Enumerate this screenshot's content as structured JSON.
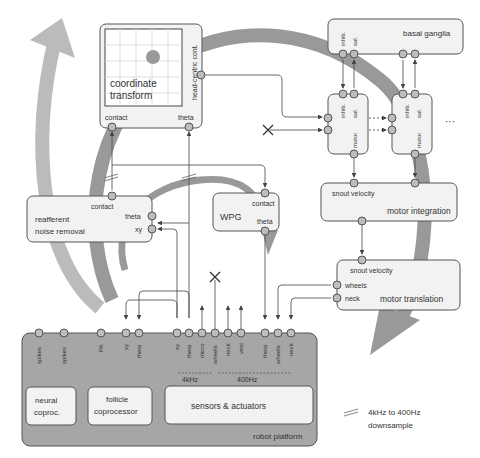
{
  "diagram": {
    "colors": {
      "box_fill": "#f2f2f2",
      "box_stroke": "#555555",
      "platform_fill": "#a6a6a6",
      "arc": "#999999",
      "port_fill": "#bdbdbd"
    },
    "modules": {
      "coordinate_transform": {
        "title_line1": "coordinate",
        "title_line2": "transform",
        "side_label": "head-centric cont.",
        "port_contact": "contact",
        "port_theta": "theta"
      },
      "basal_ganglia": {
        "title": "basal ganglia",
        "port1": "inhib.",
        "port2": "sal."
      },
      "channel1": {
        "inhib": "inhib.",
        "sal": "sal.",
        "motor": "motor"
      },
      "channel2": {
        "inhib": "inhib.",
        "sal": "sal.",
        "motor": "motor"
      },
      "ellipsis": "···",
      "reafferent": {
        "title_line1": "reafferent",
        "title_line2": "noise removal",
        "port_contact": "contact",
        "port_theta": "theta",
        "port_xy": "xy"
      },
      "wpg": {
        "title": "WPG",
        "port_contact": "contact",
        "port_theta": "theta"
      },
      "motor_integration": {
        "title": "motor integration",
        "port_snout": "snout velocity"
      },
      "motor_translation": {
        "title": "motor translation",
        "port_snout": "snout velocity",
        "port_wheels": "wheels",
        "port_neck": "neck"
      },
      "robot_platform": {
        "title": "robot platform",
        "ports": [
          "spikes",
          "spikes",
          "PA",
          "xy",
          "theta",
          "xy",
          "theta",
          "micro",
          "wheels",
          "neck",
          "vest",
          "theta",
          "wheels",
          "neck"
        ],
        "rate_4k": "4kHz",
        "rate_400": "400Hz",
        "neural": {
          "line1": "neural",
          "line2": "coproc."
        },
        "follicle": {
          "line1": "follicle",
          "line2": "coprocessor"
        },
        "sensors": "sensors & actuators"
      }
    },
    "legend": {
      "line1": "4kHz to 400Hz",
      "line2": "downsample"
    }
  }
}
